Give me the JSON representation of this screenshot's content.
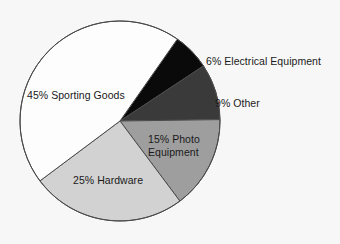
{
  "chart_data": {
    "type": "pie",
    "title": "",
    "subtitle": "",
    "xlabel": "",
    "ylabel": "",
    "grid": false,
    "legend_position": "none",
    "labels_inline": true,
    "categories": [
      "Sporting Goods",
      "Hardware",
      "Photo Equipment",
      "Other",
      "Electrical Equipment"
    ],
    "values": [
      45,
      25,
      15,
      9,
      6
    ],
    "units": "percent",
    "total": 100,
    "slices": [
      {
        "name": "Electrical Equipment",
        "value": 6,
        "label": "6% Electrical Equipment",
        "percent_text": "6%",
        "color": "#0a0a0a",
        "label_placement": "outside-right",
        "start_angle": -55,
        "end_angle": -33.4
      },
      {
        "name": "Other",
        "value": 9,
        "label": "9% Other",
        "percent_text": "9%",
        "color": "#3a3a3a",
        "label_placement": "outside-right",
        "start_angle": -33.4,
        "end_angle": -0.8
      },
      {
        "name": "Photo Equipment",
        "value": 15,
        "label_line1": "15% Photo",
        "label_line2": "Equipment",
        "label": "15% Photo Equipment",
        "percent_text": "15%",
        "color": "#9e9e9e",
        "label_placement": "inside",
        "start_angle": -0.8,
        "end_angle": 53.2
      },
      {
        "name": "Hardware",
        "value": 25,
        "label": "25% Hardware",
        "percent_text": "25%",
        "color": "#d2d2d2",
        "label_placement": "inside",
        "start_angle": 53.2,
        "end_angle": 143.2
      },
      {
        "name": "Sporting Goods",
        "value": 45,
        "label": "45% Sporting Goods",
        "percent_text": "45%",
        "color": "#fdfdfd",
        "label_placement": "inside",
        "start_angle": 143.2,
        "end_angle": 305
      }
    ],
    "geometry": {
      "center_x": 120,
      "center_y": 121,
      "radius": 100,
      "outline_color": "#4a4a4a"
    },
    "background_color": "#f7f7f7"
  }
}
